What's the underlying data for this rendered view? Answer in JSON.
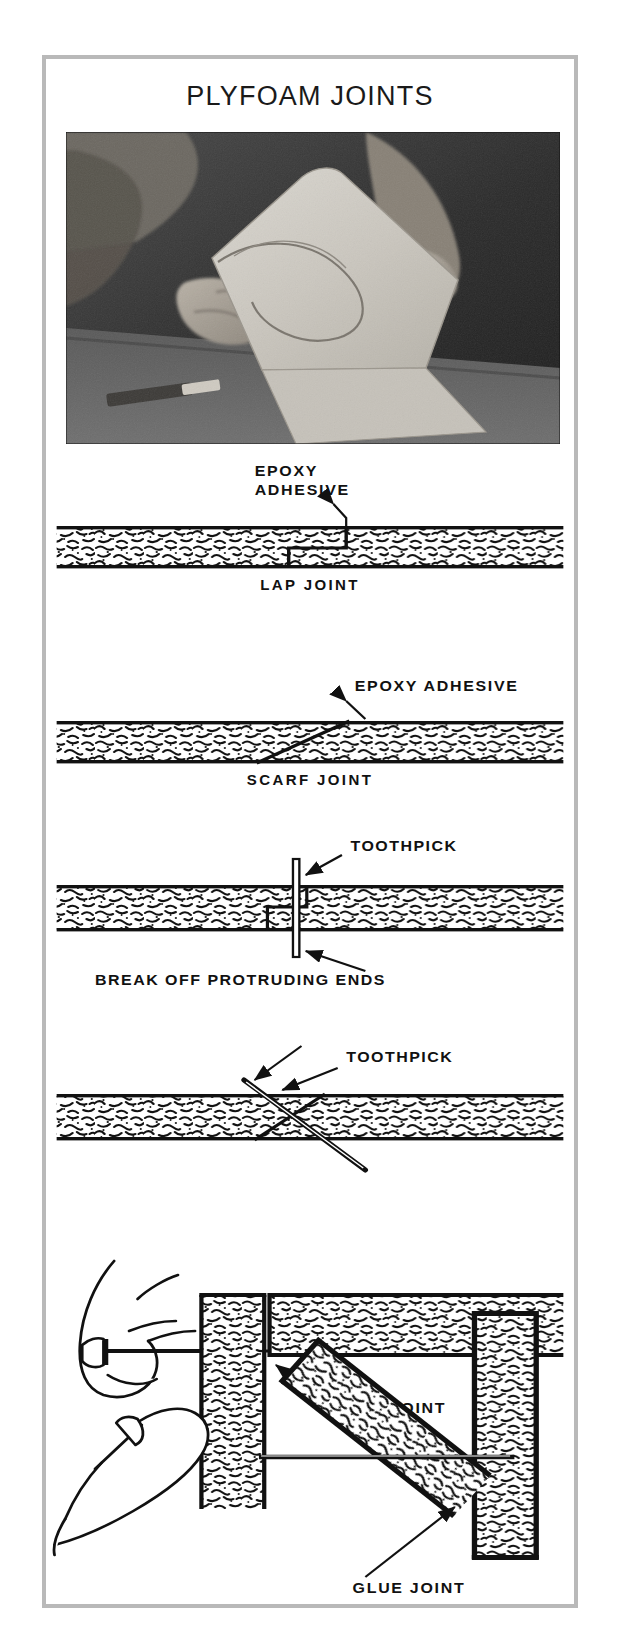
{
  "page": {
    "title": "PLYFOAM JOINTS",
    "frame_color": "#b9b9b9",
    "background": "#ffffff",
    "ink_color": "#111111"
  },
  "photo": {
    "name": "plyfoam-panel-photo",
    "description": "Hands holding a cut plyfoam panel over a workbench",
    "alt": "A person holds a large light-colored foam panel with a curved cutout; a knife lies on the bench below."
  },
  "diagrams": [
    {
      "id": "lap-joint",
      "caption": "LAP JOINT",
      "labels": [
        {
          "id": "epoxy-adhesive",
          "lines": [
            "EPOXY",
            "ADHESIVE"
          ]
        }
      ]
    },
    {
      "id": "scarf-joint",
      "caption": "SCARF JOINT",
      "labels": [
        {
          "id": "epoxy-adhesive",
          "lines": [
            "EPOXY  ADHESIVE"
          ]
        }
      ]
    },
    {
      "id": "lap-joint-toothpick",
      "caption": "",
      "labels": [
        {
          "id": "toothpick",
          "lines": [
            "TOOTHPICK"
          ]
        },
        {
          "id": "break-off-ends",
          "lines": [
            "BREAK OFF  PROTRUDING  ENDS"
          ]
        }
      ]
    },
    {
      "id": "scarf-joint-toothpick",
      "caption": "",
      "labels": [
        {
          "id": "toothpick",
          "lines": [
            "TOOTHPICK"
          ]
        }
      ]
    },
    {
      "id": "glue-joint-tee",
      "caption": "",
      "labels": [
        {
          "id": "glue-joint",
          "lines": [
            "GLUE  JOINT"
          ]
        }
      ]
    },
    {
      "id": "glue-joint-angled",
      "caption": "",
      "labels": [
        {
          "id": "glue-joint",
          "lines": [
            "GLUE  JOINT"
          ]
        }
      ]
    }
  ]
}
